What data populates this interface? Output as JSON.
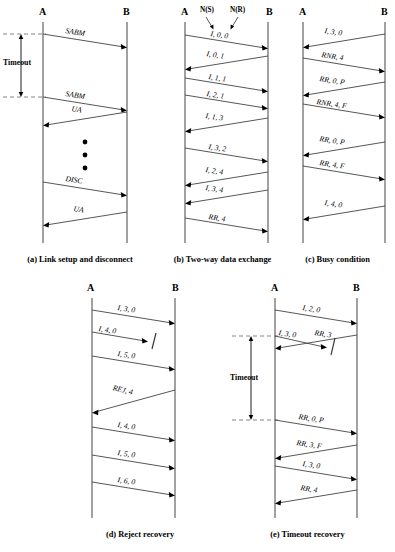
{
  "figure": {
    "node_a": "A",
    "node_b": "B",
    "timeout_label": "Timeout",
    "ns_label": "N(S)",
    "nr_label": "N(R)"
  },
  "panels": [
    {
      "id": "a",
      "caption": "(a) Link setup and disconnect",
      "node_a": "A",
      "node_b": "B",
      "has_timeout": true,
      "timeout_label": "Timeout",
      "has_ellipsis": true,
      "frames": [
        {
          "label": "SABM",
          "dir": "a-to-b",
          "lost": false
        },
        {
          "label": "SABM",
          "dir": "a-to-b",
          "lost": false
        },
        {
          "label": "UA",
          "dir": "b-to-a",
          "lost": false
        },
        {
          "label": "DISC",
          "dir": "a-to-b",
          "lost": false
        },
        {
          "label": "UA",
          "dir": "b-to-a",
          "lost": false
        }
      ]
    },
    {
      "id": "b",
      "caption": "(b) Two-way data exchange",
      "node_a": "A",
      "node_b": "B",
      "has_timeout": false,
      "has_ns_nr": true,
      "ns_label": "N(S)",
      "nr_label": "N(R)",
      "frames": [
        {
          "label": "I, 0, 0",
          "dir": "a-to-b",
          "lost": false
        },
        {
          "label": "I, 0, 1",
          "dir": "b-to-a",
          "lost": false
        },
        {
          "label": "I, 1, 1",
          "dir": "a-to-b",
          "lost": false
        },
        {
          "label": "I, 2, 1",
          "dir": "a-to-b",
          "lost": false
        },
        {
          "label": "I, 1, 3",
          "dir": "b-to-a",
          "lost": false
        },
        {
          "label": "I, 3, 2",
          "dir": "a-to-b",
          "lost": false
        },
        {
          "label": "I, 2, 4",
          "dir": "b-to-a",
          "lost": false
        },
        {
          "label": "I, 3, 4",
          "dir": "b-to-a",
          "lost": false
        },
        {
          "label": "RR, 4",
          "dir": "a-to-b",
          "lost": false
        }
      ]
    },
    {
      "id": "c",
      "caption": "(c) Busy condition",
      "node_a": "A",
      "node_b": "B",
      "has_timeout": false,
      "frames": [
        {
          "label": "I, 3, 0",
          "dir": "b-to-a",
          "lost": false
        },
        {
          "label": "RNR, 4",
          "dir": "a-to-b",
          "lost": false
        },
        {
          "label": "RR, 0, P",
          "dir": "b-to-a",
          "lost": false
        },
        {
          "label": "RNR, 4, F",
          "dir": "a-to-b",
          "lost": false
        },
        {
          "label": "RR, 0, P",
          "dir": "b-to-a",
          "lost": false
        },
        {
          "label": "RR, 4, F",
          "dir": "a-to-b",
          "lost": false
        },
        {
          "label": "I, 4, 0",
          "dir": "b-to-a",
          "lost": false
        }
      ]
    },
    {
      "id": "d",
      "caption": "(d) Reject recovery",
      "node_a": "A",
      "node_b": "B",
      "has_timeout": false,
      "frames": [
        {
          "label": "I, 3, 0",
          "dir": "a-to-b",
          "lost": false
        },
        {
          "label": "I, 4, 0",
          "dir": "a-to-b",
          "lost": true
        },
        {
          "label": "I, 5, 0",
          "dir": "a-to-b",
          "lost": false
        },
        {
          "label": "REJ, 4",
          "dir": "b-to-a",
          "lost": false
        },
        {
          "label": "I, 4, 0",
          "dir": "a-to-b",
          "lost": false
        },
        {
          "label": "I, 5, 0",
          "dir": "a-to-b",
          "lost": false
        },
        {
          "label": "I, 6, 0",
          "dir": "a-to-b",
          "lost": false
        }
      ]
    },
    {
      "id": "e",
      "caption": "(e) Timeout recovery",
      "node_a": "A",
      "node_b": "B",
      "has_timeout": true,
      "timeout_label": "Timeout",
      "frames": [
        {
          "label": "I, 2, 0",
          "dir": "a-to-b",
          "lost": false
        },
        {
          "label": "I, 3, 0",
          "dir": "b-to-a",
          "lost": false
        },
        {
          "label": "RR, 3",
          "dir": "a-to-b",
          "lost": true
        },
        {
          "label": "RR, 0, P",
          "dir": "a-to-b",
          "lost": false
        },
        {
          "label": "RR, 3, F",
          "dir": "b-to-a",
          "lost": false
        },
        {
          "label": "I, 3, 0",
          "dir": "a-to-b",
          "lost": false
        },
        {
          "label": "RR, 4",
          "dir": "b-to-a",
          "lost": false
        }
      ]
    }
  ]
}
